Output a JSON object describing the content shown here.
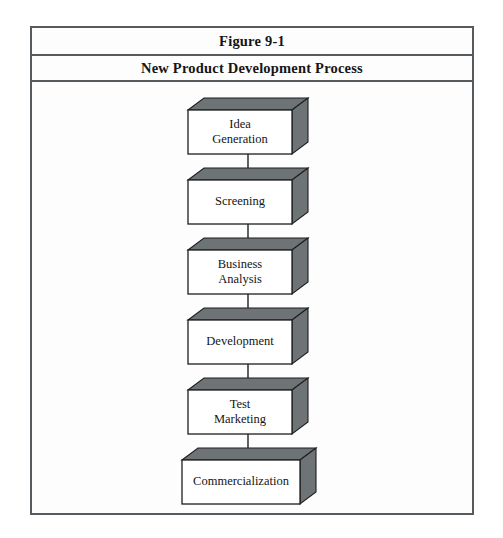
{
  "figure": {
    "number": "Figure 9-1",
    "subtitle": "New Product Development Process"
  },
  "colors": {
    "frame_border": "#555b5e",
    "box_shadow_face": "#6e7376",
    "box_front_face": "#ffffff",
    "outline": "#1d1f20",
    "page_background": "#ffffff",
    "text": "#141414"
  },
  "diagram": {
    "type": "flowchart",
    "orientation": "vertical",
    "arrow_direction": "down",
    "node_count": 6,
    "nodes": [
      {
        "id": "idea-generation",
        "label": "Idea\nGeneration"
      },
      {
        "id": "screening",
        "label": "Screening"
      },
      {
        "id": "business-analysis",
        "label": "Business\nAnalysis"
      },
      {
        "id": "development",
        "label": "Development"
      },
      {
        "id": "test-marketing",
        "label": "Test\nMarketing"
      },
      {
        "id": "commercialization",
        "label": "Commercialization"
      }
    ],
    "edges": [
      {
        "from": "idea-generation",
        "to": "screening"
      },
      {
        "from": "screening",
        "to": "business-analysis"
      },
      {
        "from": "business-analysis",
        "to": "development"
      },
      {
        "from": "development",
        "to": "test-marketing"
      },
      {
        "from": "test-marketing",
        "to": "commercialization"
      }
    ]
  }
}
